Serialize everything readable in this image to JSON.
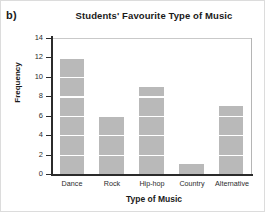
{
  "part_label": "b)",
  "chart_data": {
    "type": "bar",
    "title": "Students' Favourite Type of Music",
    "xlabel": "Type of Music",
    "ylabel": "Frequency",
    "categories": [
      "Dance",
      "Rock",
      "Hip-hop",
      "Country",
      "Alternative"
    ],
    "values": [
      12,
      6,
      9,
      1,
      7
    ],
    "ylim": [
      0,
      14
    ],
    "ytick_step": 2,
    "yticks": [
      0,
      2,
      4,
      6,
      8,
      10,
      12,
      14
    ],
    "ytick_labels": [
      "0",
      "2",
      "4",
      "6",
      "8",
      "10",
      "12",
      "14"
    ],
    "grid": "horizontal",
    "legend": "none",
    "bar_color": "#b9b9b9",
    "axis_color": "#2b2b2b",
    "gridline_color": "#c9c9c9"
  }
}
